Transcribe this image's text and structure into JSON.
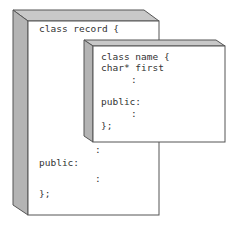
{
  "diagram": {
    "colors": {
      "face": "#ffffff",
      "side": "#b4b4b4",
      "top": "#c8c8c8",
      "stroke": "#555555",
      "text": "#333333"
    },
    "outer_box": {
      "title": "class record {",
      "lines": [
        {
          "text": ":",
          "x": 95,
          "y": 149
        },
        {
          "text": "public:",
          "x": 39,
          "y": 162
        },
        {
          "text": ":",
          "x": 95,
          "y": 178
        },
        {
          "text": "};",
          "x": 39,
          "y": 193
        }
      ]
    },
    "inner_box": {
      "lines": [
        {
          "text": "class name {",
          "x": 101,
          "y": 52
        },
        {
          "text": "char* first",
          "x": 101,
          "y": 63
        },
        {
          "text": ":",
          "x": 131,
          "y": 75
        },
        {
          "text": "public:",
          "x": 101,
          "y": 97
        },
        {
          "text": ":",
          "x": 131,
          "y": 109
        },
        {
          "text": "};",
          "x": 101,
          "y": 121
        }
      ]
    }
  }
}
